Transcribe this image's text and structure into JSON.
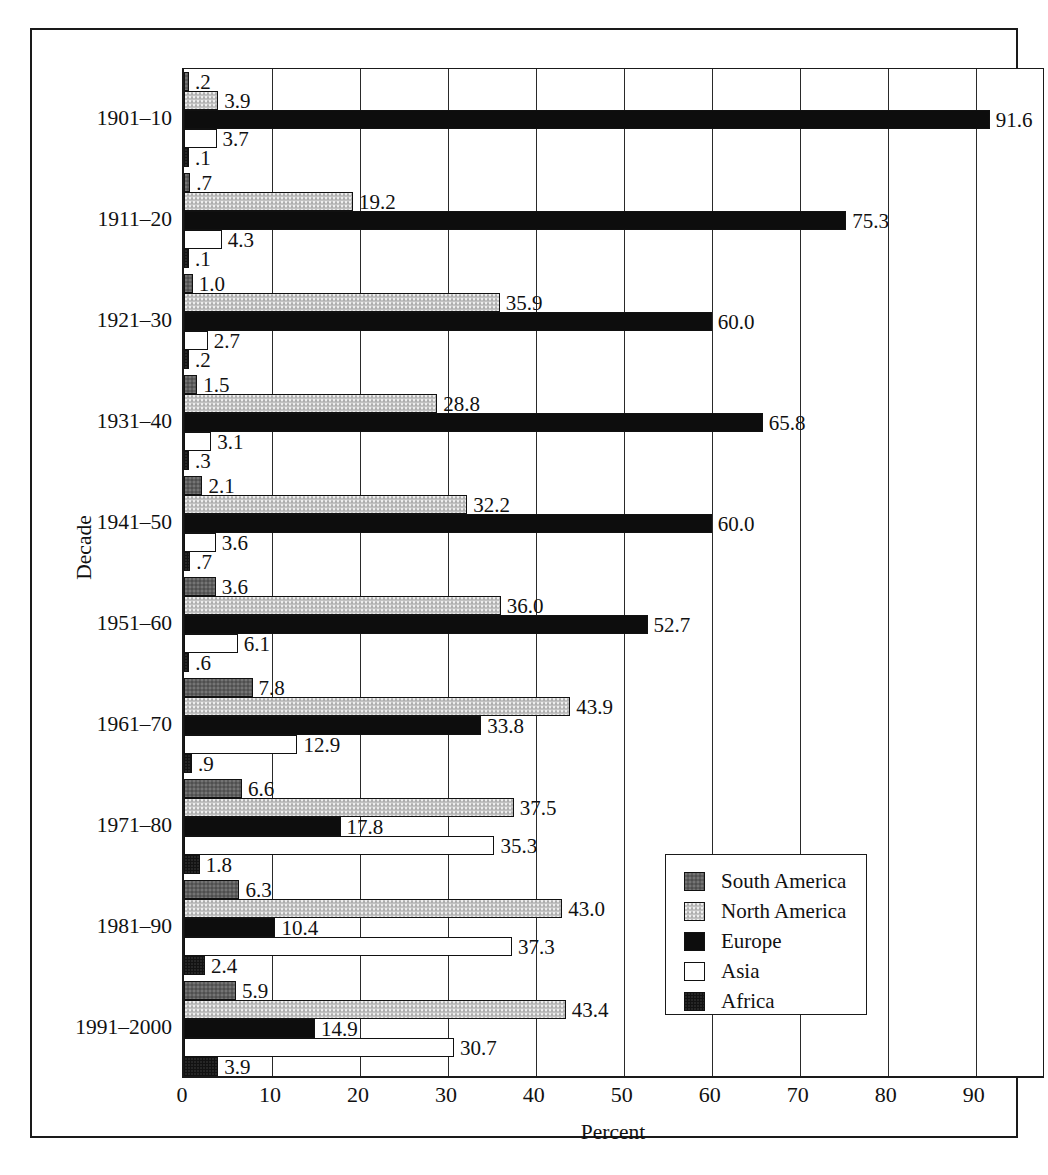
{
  "chart_data": {
    "type": "bar",
    "orientation": "horizontal",
    "title": "",
    "xlabel": "Percent",
    "ylabel": "Decade",
    "xlim": [
      0,
      98
    ],
    "xticks": [
      0,
      10,
      20,
      30,
      40,
      50,
      60,
      70,
      80,
      90
    ],
    "grid": true,
    "legend_position": "bottom-right",
    "categories": [
      "1901–10",
      "1911–20",
      "1921–30",
      "1931–40",
      "1941–50",
      "1951–60",
      "1961–70",
      "1971–80",
      "1981–90",
      "1991–2000"
    ],
    "series": [
      {
        "name": "South America",
        "color": "#5e5e5e",
        "values": [
          0.2,
          0.7,
          1.0,
          1.5,
          2.1,
          3.6,
          7.8,
          6.6,
          6.3,
          5.9
        ],
        "labels": [
          ".2",
          ".7",
          "1.0",
          "1.5",
          "2.1",
          "3.6",
          "7.8",
          "6.6",
          "6.3",
          "5.9"
        ]
      },
      {
        "name": "North America",
        "color": "#c2c2c2",
        "values": [
          3.9,
          19.2,
          35.9,
          28.8,
          32.2,
          36.0,
          43.9,
          37.5,
          43.0,
          43.4
        ],
        "labels": [
          "3.9",
          "19.2",
          "35.9",
          "28.8",
          "32.2",
          "36.0",
          "43.9",
          "37.5",
          "43.0",
          "43.4"
        ]
      },
      {
        "name": "Europe",
        "color": "#0d0d0d",
        "values": [
          91.6,
          75.3,
          60.0,
          65.8,
          60.0,
          52.7,
          33.8,
          17.8,
          10.4,
          14.9
        ],
        "labels": [
          "91.6",
          "75.3",
          "60.0",
          "65.8",
          "60.0",
          "52.7",
          "33.8",
          "17.8",
          "10.4",
          "14.9"
        ]
      },
      {
        "name": "Asia",
        "color": "#ffffff",
        "values": [
          3.7,
          4.3,
          2.7,
          3.1,
          3.6,
          6.1,
          12.9,
          35.3,
          37.3,
          30.7
        ],
        "labels": [
          "3.7",
          "4.3",
          "2.7",
          "3.1",
          "3.6",
          "6.1",
          "12.9",
          "35.3",
          "37.3",
          "30.7"
        ]
      },
      {
        "name": "Africa",
        "color": "#121212",
        "values": [
          0.1,
          0.1,
          0.2,
          0.3,
          0.7,
          0.6,
          0.9,
          1.8,
          2.4,
          3.9
        ],
        "labels": [
          ".1",
          ".1",
          ".2",
          ".3",
          ".7",
          ".6",
          ".9",
          "1.8",
          "2.4",
          "3.9"
        ]
      }
    ]
  }
}
